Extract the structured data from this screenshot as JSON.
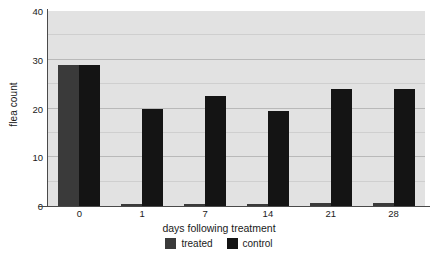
{
  "chart_data": {
    "type": "bar",
    "title": "",
    "xlabel": "days following treatment",
    "ylabel": "flea count",
    "categories": [
      "0",
      "1",
      "7",
      "14",
      "21",
      "28"
    ],
    "series": [
      {
        "name": "treated",
        "color": "#3a3a3a",
        "values": [
          29,
          0.4,
          0.4,
          0.4,
          0.6,
          0.6
        ]
      },
      {
        "name": "control",
        "color": "#141414",
        "values": [
          29,
          20,
          22.5,
          19.5,
          24,
          24
        ]
      }
    ],
    "ylim": [
      0,
      40
    ],
    "yticks": [
      0,
      10,
      20,
      30,
      40
    ],
    "ytick_labels": [
      "0",
      "10",
      "20",
      "30",
      "40"
    ],
    "minor_gridlines": [
      5,
      15,
      25,
      35
    ],
    "grid": true,
    "legend_position": "bottom",
    "plot_background": "#e2e2e2",
    "gridline_color": "#b9b9b9",
    "axis_color": "#4a4a4a"
  },
  "legend": {
    "entries": [
      {
        "label": "treated"
      },
      {
        "label": "control"
      }
    ]
  }
}
